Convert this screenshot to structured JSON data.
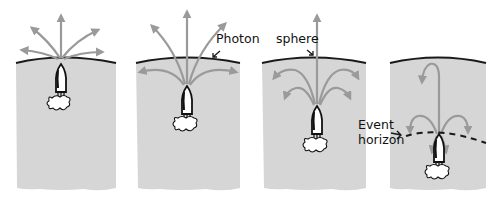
{
  "diagram": {
    "colors": {
      "background": "#ffffff",
      "gravity_region": "#d6d6d6",
      "surface_curve": "#1a1a1a",
      "photon_arrow": "#9a9a9a",
      "rocket_outline": "#111111",
      "rocket_fill": "#ffffff",
      "event_horizon_dash": "#1a1a1a"
    },
    "labels": {
      "photon_sphere": "Photon sphere",
      "photon_word": "Photon",
      "sphere_word": "sphere",
      "event_horizon_line1": "Event",
      "event_horizon_line2": "horizon"
    },
    "panels": [
      {
        "id": 1,
        "description": "Rocket far outside photon sphere; light escapes in most directions"
      },
      {
        "id": 2,
        "description": "Rocket closer; sideways light bends back but upward cone escapes"
      },
      {
        "id": 3,
        "description": "Rocket near horizon; only near-vertical ray escapes"
      },
      {
        "id": 4,
        "description": "Rocket at event horizon; all light falls back"
      }
    ]
  }
}
